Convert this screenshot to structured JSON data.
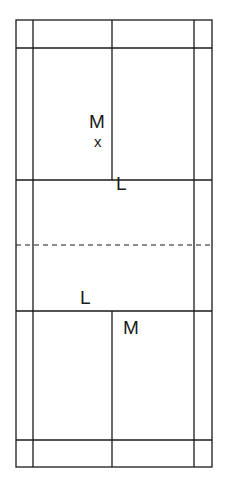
{
  "diagram": {
    "type": "badminton-court",
    "stroke_color": "#1a1a1a",
    "background": "#ffffff",
    "court": {
      "outer": {
        "x1": 16,
        "y1": 20,
        "x2": 212,
        "y2": 467
      },
      "singles_sidelines_x": [
        33,
        194
      ],
      "center_line_x": 112,
      "back_service_lines_y": [
        48,
        440
      ],
      "short_service_lines_y": [
        180,
        311
      ],
      "net_y": 245
    },
    "labels": {
      "top_m": "M",
      "top_x": "x",
      "top_l": "L",
      "bottom_l": "L",
      "bottom_m": "M"
    }
  }
}
